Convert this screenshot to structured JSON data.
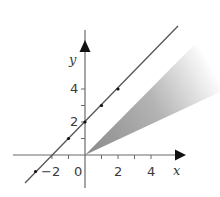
{
  "diagram": {
    "type": "coordinate-plane",
    "axes": {
      "x_label": "x",
      "y_label": "y",
      "origin_label": "0",
      "x_tick_labels": [
        {
          "value": -2,
          "text": "−2"
        },
        {
          "value": 2,
          "text": "2"
        },
        {
          "value": 4,
          "text": "4"
        }
      ],
      "y_tick_labels": [
        {
          "value": 2,
          "text": "2"
        },
        {
          "value": 4,
          "text": "4"
        }
      ],
      "x_ticks": [
        -2,
        -1,
        1,
        2,
        3,
        4
      ],
      "y_ticks": [
        1,
        2,
        3,
        4
      ]
    },
    "line": {
      "equation": "y = x + 2",
      "points": [
        [
          -3,
          -1
        ],
        [
          -1,
          1
        ],
        [
          0,
          2
        ],
        [
          1,
          3
        ],
        [
          2,
          4
        ]
      ],
      "color": "#555555"
    },
    "shaded_region": {
      "description": "wedge from origin, bounded between rays, fading to white",
      "vertex": [
        0,
        0
      ],
      "color_start": "#8a8a8a",
      "color_end": "#ffffff"
    }
  }
}
